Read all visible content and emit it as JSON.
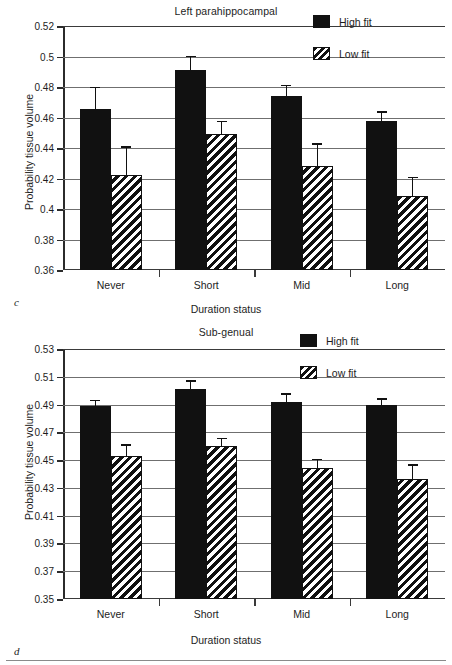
{
  "figure": {
    "background": "#ffffff",
    "ink": "#111111",
    "gridline_color": "#6f6f6f"
  },
  "panels": [
    {
      "letter": "c",
      "title": "Left parahippocampal",
      "ylabel": "Probability tissue volume",
      "xlabel": "Duration status",
      "legend": [
        {
          "label": "High fit",
          "swatch": "solid-black-square"
        },
        {
          "label": "Low fit",
          "swatch": "diagonal-hatched-square"
        }
      ],
      "yticks": [
        "0.52",
        "0.5",
        "0.48",
        "0.46",
        "0.44",
        "0.42",
        "0.4",
        "0.38",
        "0.36"
      ],
      "xticklabels": [
        "Never",
        "Short",
        "Mid",
        "Long"
      ]
    },
    {
      "letter": "d",
      "title": "Sub-genual",
      "ylabel": "Probability tissue volume",
      "xlabel": "Duration status",
      "legend": [
        {
          "label": "High fit",
          "swatch": "solid-black-square"
        },
        {
          "label": "Low fit",
          "swatch": "diagonal-hatched-square"
        }
      ],
      "yticks": [
        "0.53",
        "0.51",
        "0.49",
        "0.47",
        "0.45",
        "0.43",
        "0.41",
        "0.39",
        "0.37",
        "0.35"
      ],
      "xticklabels": [
        "Never",
        "Short",
        "Mid",
        "Long"
      ]
    }
  ],
  "chart_data": [
    {
      "id": "c",
      "type": "bar",
      "title": "Left parahippocampal",
      "panel_label": "c",
      "xlabel": "Duration status",
      "ylabel": "Probability tissue volume",
      "ylim": [
        0.36,
        0.52
      ],
      "ytick_step": 0.02,
      "yticks": [
        0.36,
        0.38,
        0.4,
        0.42,
        0.44,
        0.46,
        0.48,
        0.5,
        0.52
      ],
      "grid": "horizontal",
      "legend_position": "top-right-inside",
      "categories": [
        "Never",
        "Short",
        "Mid",
        "Long"
      ],
      "series": [
        {
          "name": "High fit",
          "fill": "solid-black",
          "values": [
            0.4655,
            0.491,
            0.474,
            0.4575
          ],
          "errors": [
            0.0145,
            0.0095,
            0.0075,
            0.0065
          ]
        },
        {
          "name": "Low fit",
          "fill": "diagonal-hatch",
          "values": [
            0.4225,
            0.4495,
            0.428,
            0.4085
          ],
          "errors": [
            0.0185,
            0.0085,
            0.015,
            0.0125
          ]
        }
      ]
    },
    {
      "id": "d",
      "type": "bar",
      "title": "Sub-genual",
      "panel_label": "d",
      "xlabel": "Duration status",
      "ylabel": "Probability tissue volume",
      "ylim": [
        0.35,
        0.53
      ],
      "ytick_step": 0.02,
      "yticks": [
        0.35,
        0.37,
        0.39,
        0.41,
        0.43,
        0.45,
        0.47,
        0.49,
        0.51,
        0.53
      ],
      "grid": "horizontal",
      "legend_position": "top-right-inside",
      "categories": [
        "Never",
        "Short",
        "Mid",
        "Long"
      ],
      "series": [
        {
          "name": "High fit",
          "fill": "solid-black",
          "values": [
            0.489,
            0.501,
            0.492,
            0.4895
          ],
          "errors": [
            0.0045,
            0.0065,
            0.006,
            0.005
          ]
        },
        {
          "name": "Low fit",
          "fill": "diagonal-hatch",
          "values": [
            0.453,
            0.4605,
            0.444,
            0.4365
          ],
          "errors": [
            0.0085,
            0.0055,
            0.007,
            0.0105
          ]
        }
      ]
    }
  ]
}
